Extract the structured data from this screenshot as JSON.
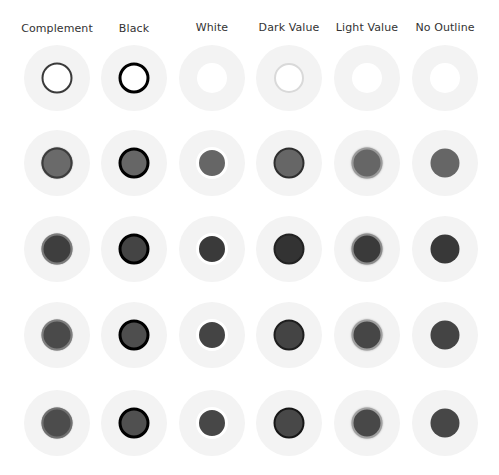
{
  "columns": [
    {
      "label": "Complement",
      "outline": "complement"
    },
    {
      "label": "Black",
      "outline": "black"
    },
    {
      "label": "White",
      "outline": "white"
    },
    {
      "label": "Dark Value",
      "outline": "dark"
    },
    {
      "label": "Light Value",
      "outline": "light"
    },
    {
      "label": "No Outline",
      "outline": "none"
    }
  ],
  "rows": [
    {
      "name": "white-fill",
      "cells": [
        {
          "fill": "#ffffff",
          "outline": "#3a3a3a",
          "style": "ring"
        },
        {
          "fill": "#ffffff",
          "outline": "#000000",
          "style": "ring"
        },
        {
          "fill": "#ffffff",
          "outline": "#ffffff",
          "style": "ring"
        },
        {
          "fill": "#ffffff",
          "outline": "#d9d9d9",
          "style": "ring"
        },
        {
          "fill": "#ffffff",
          "outline": "#ffffff",
          "style": "ring"
        },
        {
          "fill": "#ffffff",
          "outline": "none",
          "style": "plain"
        }
      ]
    },
    {
      "name": "mid-gray-fill",
      "cells": [
        {
          "fill": "#6a6a6a",
          "outline": "#3c3c3c",
          "style": "ring"
        },
        {
          "fill": "#666666",
          "outline": "#000000",
          "style": "ring"
        },
        {
          "fill": "#666666",
          "outline": "#ffffff",
          "style": "ring"
        },
        {
          "fill": "#666666",
          "outline": "#2e2e2e",
          "style": "ring"
        },
        {
          "fill": "#666666",
          "outline": "#9a9a9a",
          "style": "ring"
        },
        {
          "fill": "#666666",
          "outline": "none",
          "style": "plain"
        }
      ]
    },
    {
      "name": "dark-gray-fill",
      "cells": [
        {
          "fill": "#3e3e3e",
          "outline": "#7a7a7a",
          "style": "ring"
        },
        {
          "fill": "#444444",
          "outline": "#000000",
          "style": "ring"
        },
        {
          "fill": "#3a3a3a",
          "outline": "#ffffff",
          "style": "ring"
        },
        {
          "fill": "#333333",
          "outline": "#222222",
          "style": "ring"
        },
        {
          "fill": "#3a3a3a",
          "outline": "#8a8a8a",
          "style": "ring"
        },
        {
          "fill": "#383838",
          "outline": "none",
          "style": "plain"
        }
      ]
    },
    {
      "name": "charcoal-fill",
      "cells": [
        {
          "fill": "#4a4a4a",
          "outline": "#7e7e7e",
          "style": "ring"
        },
        {
          "fill": "#4e4e4e",
          "outline": "#000000",
          "style": "ring"
        },
        {
          "fill": "#444444",
          "outline": "#ffffff",
          "style": "ring"
        },
        {
          "fill": "#444444",
          "outline": "#1e1e1e",
          "style": "ring"
        },
        {
          "fill": "#464646",
          "outline": "#9e9e9e",
          "style": "ring"
        },
        {
          "fill": "#444444",
          "outline": "none",
          "style": "plain"
        }
      ]
    },
    {
      "name": "slate-fill",
      "cells": [
        {
          "fill": "#4c4c4c",
          "outline": "#707070",
          "style": "ring"
        },
        {
          "fill": "#505050",
          "outline": "#000000",
          "style": "ring"
        },
        {
          "fill": "#474747",
          "outline": "#ffffff",
          "style": "ring"
        },
        {
          "fill": "#484848",
          "outline": "#161616",
          "style": "ring"
        },
        {
          "fill": "#484848",
          "outline": "#a0a0a0",
          "style": "ring"
        },
        {
          "fill": "#474747",
          "outline": "none",
          "style": "plain"
        }
      ]
    }
  ],
  "halo_color": "#f3f3f3"
}
